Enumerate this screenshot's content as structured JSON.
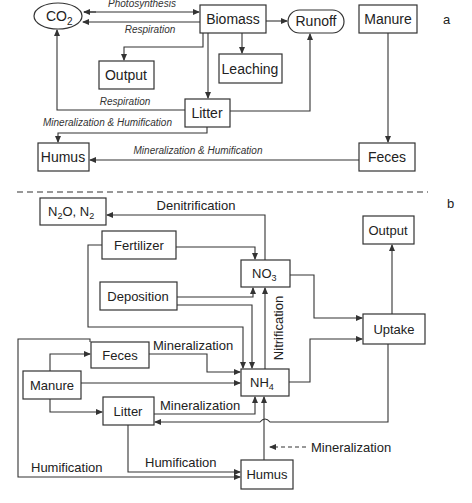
{
  "panel_a": {
    "label": "a",
    "nodes": {
      "co2": "CO",
      "co2_sub": "2",
      "biomass": "Biomass",
      "runoff": "Runoff",
      "manure": "Manure",
      "output": "Output",
      "leaching": "Leaching",
      "litter": "Litter",
      "humus": "Humus",
      "feces": "Feces"
    },
    "flows": {
      "photosynthesis": "Photosynthesis",
      "respiration_biomass": "Respiration",
      "respiration_litter": "Respiration",
      "min_hum_litter": "Mineralization & Humification",
      "min_hum_feces": "Mineralization & Humification"
    }
  },
  "panel_b": {
    "label": "b",
    "nodes": {
      "n2o": "N",
      "n2o_sub1": "2",
      "n2o_mid": "O, N",
      "n2o_sub2": "2",
      "fertilizer": "Fertilizer",
      "no3": "NO",
      "no3_sub": "3",
      "output": "Output",
      "deposition": "Deposition",
      "uptake": "Uptake",
      "feces": "Feces",
      "manure": "Manure",
      "nh4": "NH",
      "nh4_sub": "4",
      "litter": "Litter",
      "humus": "Humus"
    },
    "flows": {
      "denitrification": "Denitrification",
      "nitrification": "Nitrification",
      "min_feces": "Mineralization",
      "min_litter": "Mineralization",
      "min_humus": "Mineralization",
      "hum_litter": "Humification",
      "hum_manure": "Humification"
    }
  }
}
